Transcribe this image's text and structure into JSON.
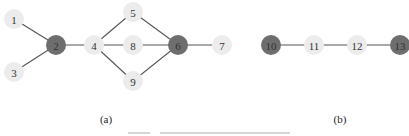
{
  "figure": {
    "panels": [
      {
        "id": "a",
        "label": "(a)",
        "label_pos": [
          106,
          123
        ],
        "nodes": [
          {
            "id": "1",
            "x": 14,
            "y": 19,
            "type": "light"
          },
          {
            "id": "2",
            "x": 56,
            "y": 45,
            "type": "dark"
          },
          {
            "id": "3",
            "x": 14,
            "y": 72,
            "type": "light"
          },
          {
            "id": "4",
            "x": 94,
            "y": 45,
            "type": "light"
          },
          {
            "id": "5",
            "x": 133,
            "y": 12,
            "type": "light"
          },
          {
            "id": "8",
            "x": 133,
            "y": 45,
            "type": "light"
          },
          {
            "id": "9",
            "x": 133,
            "y": 81,
            "type": "light"
          },
          {
            "id": "6",
            "x": 178,
            "y": 45,
            "type": "dark"
          },
          {
            "id": "7",
            "x": 222,
            "y": 45,
            "type": "light"
          }
        ],
        "edges": [
          [
            "1",
            "2"
          ],
          [
            "3",
            "2"
          ],
          [
            "2",
            "4"
          ],
          [
            "4",
            "5"
          ],
          [
            "4",
            "8"
          ],
          [
            "4",
            "9"
          ],
          [
            "5",
            "6"
          ],
          [
            "8",
            "6"
          ],
          [
            "9",
            "6"
          ],
          [
            "6",
            "7"
          ]
        ]
      },
      {
        "id": "b",
        "label": "(b)",
        "label_pos": [
          340,
          123
        ],
        "nodes": [
          {
            "id": "10",
            "x": 271,
            "y": 45,
            "type": "dark"
          },
          {
            "id": "11",
            "x": 314,
            "y": 45,
            "type": "light"
          },
          {
            "id": "12",
            "x": 357,
            "y": 45,
            "type": "light"
          },
          {
            "id": "13",
            "x": 400,
            "y": 45,
            "type": "dark"
          }
        ],
        "edges": [
          [
            "10",
            "11"
          ],
          [
            "11",
            "12"
          ],
          [
            "12",
            "13"
          ]
        ]
      }
    ],
    "node_radius": 10,
    "colors": {
      "light_node": "#ececec",
      "dark_node": "#6e6e6e",
      "edge": "#555555",
      "label": "#333333"
    },
    "caption_note": "cropped caption text at bottom edge (illegible)"
  }
}
